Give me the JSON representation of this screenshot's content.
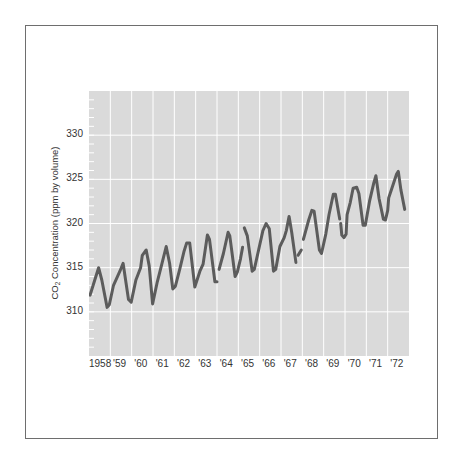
{
  "chart_data": {
    "type": "line",
    "title": "",
    "xlabel": "",
    "ylabel": "CO2 Concentration (ppm by volume)",
    "ylabel_parts": {
      "pre": "CO",
      "sub": "2",
      "post": " Concentration (ppm by volume)"
    },
    "ylim": [
      305,
      335
    ],
    "yticks": [
      310,
      315,
      320,
      325,
      330
    ],
    "xlim": [
      1958.0,
      1973.0
    ],
    "xtick_labels": [
      "1958",
      "'59",
      "'60",
      "'61",
      "'62",
      "'63",
      "'64",
      "'65",
      "'66",
      "'67",
      "'68",
      "'69",
      "'70",
      "'71",
      "'72"
    ],
    "grid": true,
    "legend": null,
    "series": [
      {
        "name": "CO2 concentration",
        "color": "#5c5c5c",
        "segments": [
          [
            [
              1958.05,
              311.9
            ],
            [
              1958.45,
              315.0
            ],
            [
              1958.6,
              313.6
            ],
            [
              1958.85,
              310.5
            ],
            [
              1958.95,
              310.8
            ],
            [
              1959.15,
              313.0
            ],
            [
              1959.45,
              314.6
            ],
            [
              1959.6,
              315.5
            ],
            [
              1959.85,
              311.4
            ],
            [
              1959.98,
              311.1
            ],
            [
              1960.2,
              313.6
            ],
            [
              1960.42,
              315.0
            ],
            [
              1960.5,
              316.4
            ],
            [
              1960.68,
              317.0
            ],
            [
              1960.82,
              315.2
            ],
            [
              1960.98,
              310.9
            ],
            [
              1961.2,
              313.4
            ],
            [
              1961.42,
              315.5
            ],
            [
              1961.62,
              317.4
            ],
            [
              1961.78,
              315.5
            ],
            [
              1961.93,
              312.6
            ],
            [
              1962.05,
              312.9
            ],
            [
              1962.25,
              314.8
            ],
            [
              1962.45,
              316.8
            ],
            [
              1962.58,
              317.8
            ],
            [
              1962.72,
              317.8
            ],
            [
              1962.96,
              312.8
            ],
            [
              1963.2,
              314.6
            ],
            [
              1963.35,
              315.4
            ],
            [
              1963.55,
              318.7
            ],
            [
              1963.65,
              318.2
            ],
            [
              1963.9,
              313.4
            ],
            [
              1964.0,
              313.4
            ]
          ],
          [
            [
              1964.1,
              314.8
            ],
            [
              1964.3,
              316.6
            ],
            [
              1964.52,
              319.0
            ],
            [
              1964.6,
              318.6
            ],
            [
              1964.85,
              314.0
            ],
            [
              1964.95,
              314.5
            ],
            [
              1965.1,
              316.0
            ],
            [
              1965.2,
              317.3
            ]
          ],
          [
            [
              1965.28,
              319.5
            ],
            [
              1965.42,
              318.6
            ],
            [
              1965.65,
              314.6
            ],
            [
              1965.75,
              314.8
            ],
            [
              1965.95,
              317.0
            ],
            [
              1966.15,
              319.2
            ],
            [
              1966.3,
              320.0
            ],
            [
              1966.45,
              319.4
            ],
            [
              1966.65,
              314.6
            ],
            [
              1966.75,
              314.8
            ],
            [
              1966.95,
              317.4
            ],
            [
              1967.15,
              318.4
            ],
            [
              1967.25,
              319.2
            ],
            [
              1967.38,
              320.8
            ],
            [
              1967.5,
              319.0
            ],
            [
              1967.7,
              315.6
            ]
          ],
          [
            [
              1967.8,
              316.4
            ],
            [
              1967.95,
              317.0
            ]
          ],
          [
            [
              1968.05,
              318.2
            ],
            [
              1968.3,
              320.4
            ],
            [
              1968.45,
              321.5
            ],
            [
              1968.55,
              321.4
            ],
            [
              1968.8,
              317.0
            ],
            [
              1968.9,
              316.6
            ],
            [
              1969.1,
              318.8
            ],
            [
              1969.25,
              321.0
            ],
            [
              1969.45,
              323.3
            ],
            [
              1969.55,
              323.3
            ],
            [
              1969.75,
              320.5
            ]
          ],
          [
            [
              1969.8,
              320.0
            ],
            [
              1969.85,
              318.7
            ],
            [
              1969.95,
              318.4
            ],
            [
              1970.05,
              318.8
            ],
            [
              1970.1,
              321.0
            ],
            [
              1970.25,
              322.4
            ],
            [
              1970.38,
              324.0
            ],
            [
              1970.55,
              324.1
            ],
            [
              1970.65,
              323.4
            ],
            [
              1970.85,
              319.8
            ],
            [
              1970.95,
              319.8
            ],
            [
              1971.15,
              322.5
            ],
            [
              1971.35,
              324.6
            ],
            [
              1971.45,
              325.4
            ],
            [
              1971.6,
              322.8
            ],
            [
              1971.8,
              320.5
            ],
            [
              1971.9,
              320.4
            ],
            [
              1972.0,
              321.5
            ],
            [
              1972.05,
              322.9
            ],
            [
              1972.2,
              324.0
            ],
            [
              1972.42,
              325.6
            ],
            [
              1972.5,
              325.9
            ],
            [
              1972.62,
              323.8
            ],
            [
              1972.8,
              321.6
            ]
          ]
        ]
      }
    ]
  },
  "colors": {
    "plot_background": "#dadada",
    "grid": "#ffffff",
    "line": "#5c5c5c",
    "frame": "#6e6e6e",
    "text": "#333333"
  }
}
